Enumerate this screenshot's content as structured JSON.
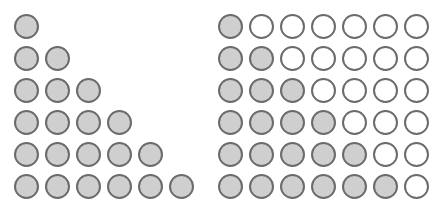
{
  "left_figure": {
    "description": "Triangular arrangement of gray circles",
    "rows": [
      1,
      2,
      3,
      4,
      5,
      6
    ]
  },
  "right_figure": {
    "description": "6x7 grid: row n has n gray circles followed by white circles",
    "columns": 7,
    "rows": [
      1,
      2,
      3,
      4,
      5,
      6
    ]
  },
  "colors": {
    "filled": "#cfcfcf",
    "empty": "#ffffff",
    "outline": "#6b6b6b"
  }
}
